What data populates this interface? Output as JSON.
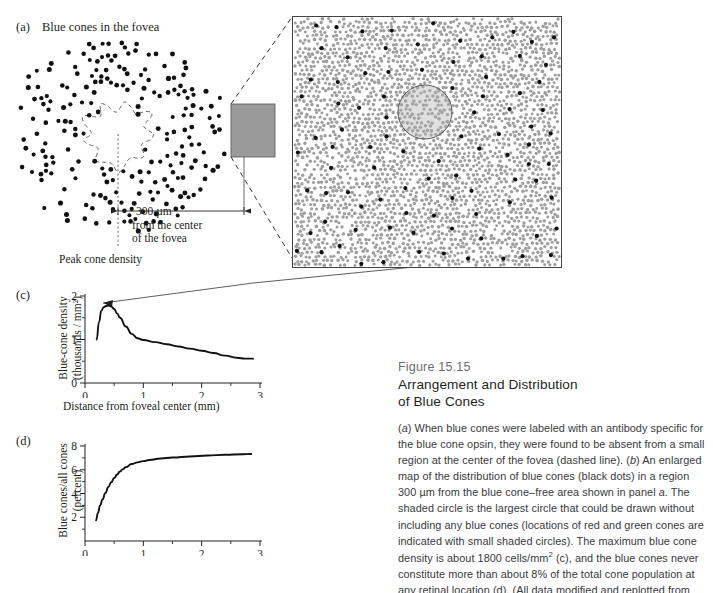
{
  "panels": {
    "a": {
      "label": "(a)",
      "title": "Blue cones in the fovea",
      "scale_label": "300 µm",
      "scale_sub_line1": "from the center",
      "scale_sub_line2": "of the fovea",
      "peak_label": "Peak cone density"
    },
    "b": {
      "label": "(b)"
    },
    "c": {
      "label": "(c)"
    },
    "d": {
      "label": "(d)"
    }
  },
  "caption": {
    "figure_number": "Figure 15.15",
    "title_line1": "Arrangement and Distribution",
    "title_line2": "of Blue Cones",
    "body_segments": [
      {
        "text": "(",
        "style": "normal"
      },
      {
        "text": "a",
        "style": "italic"
      },
      {
        "text": ") When blue cones were labeled with an antibody specific for the blue cone opsin, they were found to be absent from a small region at the center of the fovea (dashed line). (",
        "style": "normal"
      },
      {
        "text": "b",
        "style": "italic"
      },
      {
        "text": ") An enlarged map of the distribution of blue cones (black dots) in a region 300 µm from the blue cone–free area shown in panel ",
        "style": "normal"
      },
      {
        "text": "a",
        "style": "italic"
      },
      {
        "text": ". The shaded circle is the largest circle that could be drawn without including any blue cones (locations of red and green cones are indicated with small shaded circles). The maximum blue cone density is about 1800 cells/mm",
        "style": "normal"
      },
      {
        "text": "2",
        "style": "sup"
      },
      {
        "text": " (c), and the blue cones never constitute more than about 8% of the total cone population at any retinal location (d). (All data modified and replotted from Curcio et al. 1991.)",
        "style": "normal"
      }
    ]
  },
  "chart_data": [
    {
      "id": "c",
      "type": "line",
      "title": "",
      "xlabel": "Distance from foveal center (mm)",
      "ylabel_line1": "Blue-cone density",
      "ylabel_line2": "(thousands / mm²)",
      "xlim": [
        0,
        3
      ],
      "ylim": [
        0,
        2
      ],
      "xticks": [
        0,
        1,
        2,
        3
      ],
      "xtick_labels": [
        "0",
        "1",
        "2",
        "3"
      ],
      "xminor": [
        0.5,
        1.5,
        2.5
      ],
      "yticks": [
        0,
        1,
        2
      ],
      "ytick_labels": [
        "0",
        "1",
        "2"
      ],
      "yminor": [
        0.5,
        1.5
      ],
      "grid": false,
      "legend": "none",
      "x": [
        0.2,
        0.24,
        0.28,
        0.32,
        0.36,
        0.4,
        0.45,
        0.5,
        0.55,
        0.6,
        0.7,
        0.8,
        0.9,
        1.0,
        1.2,
        1.4,
        1.6,
        1.8,
        2.0,
        2.2,
        2.4,
        2.6,
        2.75,
        2.88
      ],
      "y": [
        1.0,
        1.4,
        1.66,
        1.74,
        1.77,
        1.78,
        1.76,
        1.7,
        1.6,
        1.5,
        1.3,
        1.13,
        1.03,
        0.99,
        0.94,
        0.89,
        0.84,
        0.79,
        0.74,
        0.69,
        0.63,
        0.58,
        0.56,
        0.56
      ]
    },
    {
      "id": "d",
      "type": "line",
      "title": "",
      "xlabel": "",
      "ylabel_line1": "Blue cones/all cones",
      "ylabel_line2": "(percent)",
      "xlim": [
        0,
        3
      ],
      "ylim": [
        0,
        8
      ],
      "xticks": [
        0,
        1,
        2,
        3
      ],
      "xtick_labels": [
        "0",
        "1",
        "2",
        "3"
      ],
      "xminor": [
        0.5,
        1.5,
        2.5
      ],
      "yticks": [
        2,
        4,
        6,
        8
      ],
      "ytick_labels": [
        "2",
        "4",
        "6",
        "8"
      ],
      "yminor": [
        1,
        3,
        5,
        7
      ],
      "grid": false,
      "legend": "none",
      "x": [
        0.19,
        0.22,
        0.26,
        0.3,
        0.35,
        0.4,
        0.45,
        0.5,
        0.55,
        0.6,
        0.65,
        0.7,
        0.8,
        0.9,
        1.0,
        1.1,
        1.3,
        1.5,
        1.8,
        2.1,
        2.4,
        2.7,
        2.85
      ],
      "y": [
        1.75,
        2.35,
        3.0,
        3.5,
        4.05,
        4.55,
        4.95,
        5.3,
        5.6,
        5.85,
        6.05,
        6.22,
        6.48,
        6.62,
        6.73,
        6.82,
        6.95,
        7.03,
        7.12,
        7.2,
        7.26,
        7.31,
        7.33
      ]
    }
  ]
}
